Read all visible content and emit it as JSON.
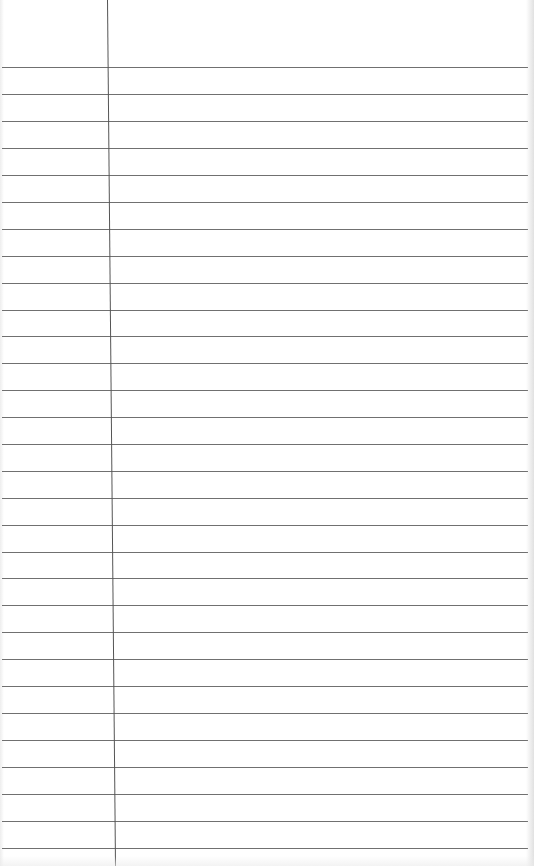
{
  "paper": {
    "type": "lined-notepad",
    "background_color": "#ffffff",
    "rule_color": "#707070",
    "margin_color": "#555555",
    "rule_spacing_px": 27,
    "first_rule_y": 67,
    "rule_count": 30,
    "margin_x_top": 107,
    "margin_x_bottom": 115,
    "rules_y": [
      67,
      94,
      121,
      148,
      175,
      202,
      229,
      256,
      283,
      310,
      336,
      363,
      390,
      417,
      444,
      471,
      498,
      525,
      552,
      578,
      605,
      632,
      659,
      686,
      713,
      740,
      767,
      794,
      821,
      848
    ]
  }
}
